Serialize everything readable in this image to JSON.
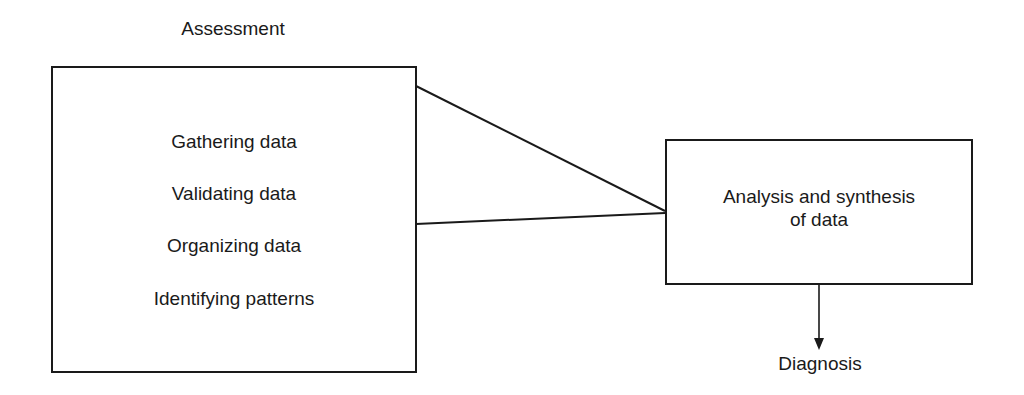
{
  "diagram": {
    "type": "flow",
    "title": "Assessment",
    "assessment_box": {
      "steps": [
        "Gathering data",
        "Validating data",
        "Organizing data",
        "Identifying patterns"
      ]
    },
    "analysis_box": {
      "line1": "Analysis and synthesis",
      "line2": "of data"
    },
    "output": {
      "label": "Diagnosis"
    },
    "edges": [
      {
        "from": "assessment_box",
        "to": "analysis_box",
        "style": "converging-lines"
      },
      {
        "from": "analysis_box",
        "to": "output",
        "style": "arrow"
      }
    ],
    "colors": {
      "stroke": "#1a1a1a",
      "background": "#ffffff"
    }
  }
}
